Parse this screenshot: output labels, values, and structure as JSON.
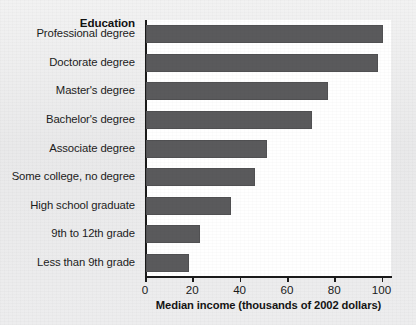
{
  "chart_data": {
    "type": "bar",
    "orientation": "horizontal",
    "title": "",
    "xlabel": "Median income (thousands of 2002 dollars)",
    "ylabel": "Education",
    "categories": [
      "Professional degree",
      "Doctorate degree",
      "Master's degree",
      "Bachelor's degree",
      "Associate degree",
      "Some college, no degree",
      "High school graduate",
      "9th to 12th grade",
      "Less than 9th grade"
    ],
    "values": [
      100,
      98,
      77,
      70,
      51,
      46,
      36,
      23,
      18
    ],
    "xlim": [
      0,
      104
    ],
    "xticks": [
      0,
      20,
      40,
      60,
      80,
      100
    ],
    "xtick_labels": [
      "0",
      "20",
      "40",
      "60",
      "80",
      "100"
    ],
    "grid": false,
    "legend": null,
    "bar_color": "#5a5a5c",
    "panel_color": "#ffffff",
    "background_color": "#ededee",
    "axis_color": "#1a1a1a"
  }
}
